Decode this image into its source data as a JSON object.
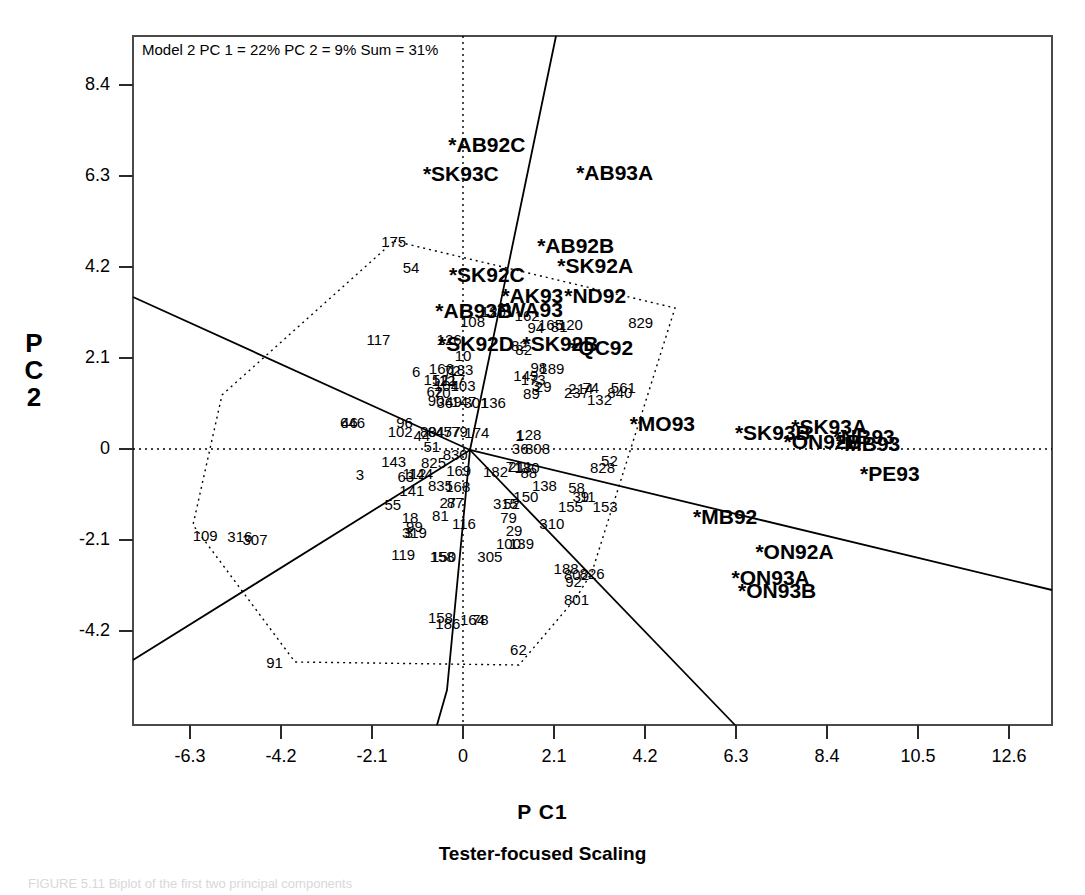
{
  "annotation": "Model 2 PC 1 = 22% PC 2 = 9% Sum = 31%",
  "axis": {
    "ylabel_line1": "P",
    "ylabel_line2": "C",
    "ylabel_line3": "2",
    "xlabel": "P C1",
    "subtitle": "Tester-focused Scaling",
    "caption": "FIGURE 5.11  Biplot of the first two principal components"
  },
  "chart_data": {
    "type": "scatter",
    "title": "Model 2 PC 1 = 22% PC 2 = 9% Sum = 31%",
    "subtitle": "Tester-focused Scaling",
    "xlabel": "P C1",
    "ylabel": "P C 2",
    "xlim": [
      -7.8,
      13.5
    ],
    "ylim": [
      -6.0,
      9.6
    ],
    "xticks": [
      -6.3,
      -4.2,
      -2.1,
      0,
      2.1,
      4.2,
      6.3,
      8.4,
      10.5,
      12.6
    ],
    "yticks": [
      8.4,
      6.3,
      4.2,
      2.1,
      0,
      -2.1,
      -4.2
    ],
    "grid": false,
    "legend": "none",
    "reference_lines": {
      "x": 0,
      "y": 0,
      "style": "dotted"
    },
    "series": [
      {
        "name": "testers",
        "style": "bold-star-label",
        "points": [
          {
            "label": "*AB92C",
            "x": 0.55,
            "y": 7.05
          },
          {
            "label": "*SK93C",
            "x": -0.05,
            "y": 6.38
          },
          {
            "label": "*AB93A",
            "x": 3.5,
            "y": 6.4
          },
          {
            "label": "*AB92B",
            "x": 2.6,
            "y": 4.7
          },
          {
            "label": "*SK92A",
            "x": 3.05,
            "y": 4.25
          },
          {
            "label": "*SK92C",
            "x": 0.55,
            "y": 4.05
          },
          {
            "label": "*AK93",
            "x": 1.6,
            "y": 3.55
          },
          {
            "label": "*ND92",
            "x": 3.05,
            "y": 3.55
          },
          {
            "label": "*AB93B",
            "x": 0.25,
            "y": 3.2
          },
          {
            "label": "*WA93",
            "x": 1.55,
            "y": 3.22
          },
          {
            "label": "*SK92D",
            "x": 0.3,
            "y": 2.45
          },
          {
            "label": "*SK92B",
            "x": 2.25,
            "y": 2.45
          },
          {
            "label": "*QC92",
            "x": 3.2,
            "y": 2.35
          },
          {
            "label": "*MO93",
            "x": 4.6,
            "y": 0.6
          },
          {
            "label": "*SK93B",
            "x": 7.15,
            "y": 0.4
          },
          {
            "label": "*SK93A",
            "x": 8.45,
            "y": 0.52
          },
          {
            "label": "*ON92B",
            "x": 8.3,
            "y": 0.18
          },
          {
            "label": "*NB93",
            "x": 9.25,
            "y": 0.3
          },
          {
            "label": "*MB93",
            "x": 9.35,
            "y": 0.15
          },
          {
            "label": "*PE93",
            "x": 9.85,
            "y": -0.55
          },
          {
            "label": "*MB92",
            "x": 6.05,
            "y": -1.55
          },
          {
            "label": "*ON92A",
            "x": 7.65,
            "y": -2.35
          },
          {
            "label": "*ON93A",
            "x": 7.1,
            "y": -2.95
          },
          {
            "label": "*ON93B",
            "x": 7.25,
            "y": -3.25
          }
        ]
      },
      {
        "name": "genotypes",
        "style": "plain-number-label",
        "points": [
          {
            "label": "175",
            "x": -1.6,
            "y": 4.8
          },
          {
            "label": "54",
            "x": -1.2,
            "y": 4.2
          },
          {
            "label": "117",
            "x": -1.95,
            "y": 2.55
          },
          {
            "label": "126",
            "x": -0.32,
            "y": 2.55
          },
          {
            "label": "108",
            "x": 0.22,
            "y": 2.95
          },
          {
            "label": "120",
            "x": 0.7,
            "y": 3.18
          },
          {
            "label": "162",
            "x": 1.48,
            "y": 3.1
          },
          {
            "label": "94",
            "x": 1.68,
            "y": 2.82
          },
          {
            "label": "165",
            "x": 2.02,
            "y": 2.88
          },
          {
            "label": "81",
            "x": 2.22,
            "y": 2.85
          },
          {
            "label": "120",
            "x": 2.48,
            "y": 2.88
          },
          {
            "label": "10",
            "x": 0.0,
            "y": 2.18
          },
          {
            "label": "82",
            "x": 1.3,
            "y": 2.4
          },
          {
            "label": "82",
            "x": 1.4,
            "y": 2.3
          },
          {
            "label": "829",
            "x": 4.1,
            "y": 2.92
          },
          {
            "label": "6",
            "x": -1.08,
            "y": 1.8
          },
          {
            "label": "166",
            "x": -0.5,
            "y": 1.88
          },
          {
            "label": "72",
            "x": -0.25,
            "y": 1.82
          },
          {
            "label": "183",
            "x": -0.05,
            "y": 1.85
          },
          {
            "label": "98",
            "x": 1.75,
            "y": 1.9
          },
          {
            "label": "189",
            "x": 2.05,
            "y": 1.88
          },
          {
            "label": "149",
            "x": 1.45,
            "y": 1.7
          },
          {
            "label": "152",
            "x": -0.62,
            "y": 1.62
          },
          {
            "label": "112",
            "x": -0.45,
            "y": 1.6
          },
          {
            "label": "117",
            "x": -0.22,
            "y": 1.62
          },
          {
            "label": "173",
            "x": 1.62,
            "y": 1.62
          },
          {
            "label": "104",
            "x": -0.38,
            "y": 1.48
          },
          {
            "label": "103",
            "x": 0.0,
            "y": 1.48
          },
          {
            "label": "3",
            "x": 1.68,
            "y": 1.48
          },
          {
            "label": "29",
            "x": 1.85,
            "y": 1.45
          },
          {
            "label": "62",
            "x": -0.65,
            "y": 1.35
          },
          {
            "label": "70",
            "x": -0.48,
            "y": 1.32
          },
          {
            "label": "89",
            "x": 1.58,
            "y": 1.3
          },
          {
            "label": "214",
            "x": 2.72,
            "y": 1.4
          },
          {
            "label": "74",
            "x": 2.95,
            "y": 1.42
          },
          {
            "label": "237",
            "x": 2.62,
            "y": 1.32
          },
          {
            "label": "561",
            "x": 3.7,
            "y": 1.42
          },
          {
            "label": "840",
            "x": 3.62,
            "y": 1.32
          },
          {
            "label": "90",
            "x": -0.62,
            "y": 1.12
          },
          {
            "label": "36",
            "x": -0.42,
            "y": 1.08
          },
          {
            "label": "49",
            "x": -0.22,
            "y": 1.1
          },
          {
            "label": "147",
            "x": 0.02,
            "y": 1.1
          },
          {
            "label": "301",
            "x": 0.3,
            "y": 1.08
          },
          {
            "label": "136",
            "x": 0.7,
            "y": 1.08
          },
          {
            "label": "132",
            "x": 3.15,
            "y": 1.15
          },
          {
            "label": "46",
            "x": -2.62,
            "y": 0.62
          },
          {
            "label": "646",
            "x": -2.55,
            "y": 0.62
          },
          {
            "label": "96",
            "x": -1.35,
            "y": 0.62
          },
          {
            "label": "102",
            "x": -1.45,
            "y": 0.42
          },
          {
            "label": "44",
            "x": -0.95,
            "y": 0.32
          },
          {
            "label": "80",
            "x": -0.8,
            "y": 0.42
          },
          {
            "label": "84",
            "x": -0.62,
            "y": 0.42
          },
          {
            "label": "45",
            "x": -0.45,
            "y": 0.42
          },
          {
            "label": "77",
            "x": -0.25,
            "y": 0.42
          },
          {
            "label": "79",
            "x": -0.08,
            "y": 0.42
          },
          {
            "label": "174",
            "x": 0.32,
            "y": 0.4
          },
          {
            "label": "1",
            "x": 1.3,
            "y": 0.32
          },
          {
            "label": "128",
            "x": 1.52,
            "y": 0.35
          },
          {
            "label": "51",
            "x": -0.72,
            "y": 0.08
          },
          {
            "label": "36",
            "x": 1.32,
            "y": 0.02
          },
          {
            "label": "808",
            "x": 1.72,
            "y": 0.02
          },
          {
            "label": "830",
            "x": -0.18,
            "y": -0.12
          },
          {
            "label": "143",
            "x": -1.6,
            "y": -0.28
          },
          {
            "label": "825",
            "x": -0.68,
            "y": -0.3
          },
          {
            "label": "52",
            "x": 3.38,
            "y": -0.25
          },
          {
            "label": "828",
            "x": 3.22,
            "y": -0.42
          },
          {
            "label": "63",
            "x": -1.32,
            "y": -0.62
          },
          {
            "label": "112",
            "x": -1.12,
            "y": -0.55
          },
          {
            "label": "144",
            "x": -0.98,
            "y": -0.55
          },
          {
            "label": "3",
            "x": -2.38,
            "y": -0.58
          },
          {
            "label": "169",
            "x": -0.1,
            "y": -0.48
          },
          {
            "label": "182",
            "x": 0.75,
            "y": -0.5
          },
          {
            "label": "71",
            "x": 1.18,
            "y": -0.4
          },
          {
            "label": "211",
            "x": 1.32,
            "y": -0.4
          },
          {
            "label": "180",
            "x": 1.48,
            "y": -0.42
          },
          {
            "label": "88",
            "x": 1.52,
            "y": -0.52
          },
          {
            "label": "835",
            "x": -0.52,
            "y": -0.82
          },
          {
            "label": "168",
            "x": -0.12,
            "y": -0.85
          },
          {
            "label": "138",
            "x": 1.88,
            "y": -0.82
          },
          {
            "label": "58",
            "x": 2.62,
            "y": -0.88
          },
          {
            "label": "141",
            "x": -1.18,
            "y": -0.95
          },
          {
            "label": "39",
            "x": 2.72,
            "y": -1.08
          },
          {
            "label": "11",
            "x": 2.88,
            "y": -1.08
          },
          {
            "label": "27",
            "x": -0.35,
            "y": -1.22
          },
          {
            "label": "87",
            "x": -0.18,
            "y": -1.22
          },
          {
            "label": "150",
            "x": 1.45,
            "y": -1.08
          },
          {
            "label": "55",
            "x": -1.62,
            "y": -1.28
          },
          {
            "label": "315",
            "x": 0.98,
            "y": -1.25
          },
          {
            "label": "52",
            "x": 1.12,
            "y": -1.25
          },
          {
            "label": "155",
            "x": 2.48,
            "y": -1.32
          },
          {
            "label": "153",
            "x": 3.28,
            "y": -1.32
          },
          {
            "label": "81",
            "x": -0.52,
            "y": -1.52
          },
          {
            "label": "18",
            "x": -1.22,
            "y": -1.58
          },
          {
            "label": "116",
            "x": 0.02,
            "y": -1.7
          },
          {
            "label": "79",
            "x": 1.05,
            "y": -1.58
          },
          {
            "label": "310",
            "x": 2.05,
            "y": -1.7
          },
          {
            "label": "99",
            "x": -1.12,
            "y": -1.78
          },
          {
            "label": "29",
            "x": 1.18,
            "y": -1.88
          },
          {
            "label": "3",
            "x": -1.25,
            "y": -1.92
          },
          {
            "label": "319",
            "x": -1.12,
            "y": -1.92
          },
          {
            "label": "100",
            "x": 1.05,
            "y": -2.18
          },
          {
            "label": "139",
            "x": 1.35,
            "y": -2.18
          },
          {
            "label": "119",
            "x": -1.38,
            "y": -2.42
          },
          {
            "label": "150",
            "x": -0.45,
            "y": -2.48
          },
          {
            "label": "158",
            "x": -0.48,
            "y": -2.48
          },
          {
            "label": "305",
            "x": 0.62,
            "y": -2.48
          },
          {
            "label": "188",
            "x": 2.38,
            "y": -2.75
          },
          {
            "label": "802",
            "x": 2.62,
            "y": -2.88
          },
          {
            "label": "826",
            "x": 2.98,
            "y": -2.85
          },
          {
            "label": "92",
            "x": 2.55,
            "y": -3.05
          },
          {
            "label": "801",
            "x": 2.62,
            "y": -3.45
          },
          {
            "label": "158",
            "x": -0.52,
            "y": -3.88
          },
          {
            "label": "186",
            "x": -0.35,
            "y": -4.02
          },
          {
            "label": "164",
            "x": 0.22,
            "y": -3.92
          },
          {
            "label": "78",
            "x": 0.4,
            "y": -3.92
          },
          {
            "label": "62",
            "x": 1.28,
            "y": -4.62
          },
          {
            "label": "109",
            "x": -5.95,
            "y": -1.98
          },
          {
            "label": "316",
            "x": -5.15,
            "y": -2.0
          },
          {
            "label": "307",
            "x": -4.8,
            "y": -2.08
          },
          {
            "label": "91",
            "x": -4.35,
            "y": -4.92
          }
        ]
      }
    ],
    "hull_polygon": {
      "style": "dotted",
      "vertices": [
        "175",
        "829",
        "826",
        "801",
        "62",
        "91",
        "109",
        "175"
      ]
    },
    "partition_lines": {
      "style": "solid",
      "count": 4,
      "origin": "near (0,0)"
    }
  },
  "colors": {
    "ink": "#000000",
    "background": "#ffffff",
    "frame": "#3a3a3a"
  }
}
